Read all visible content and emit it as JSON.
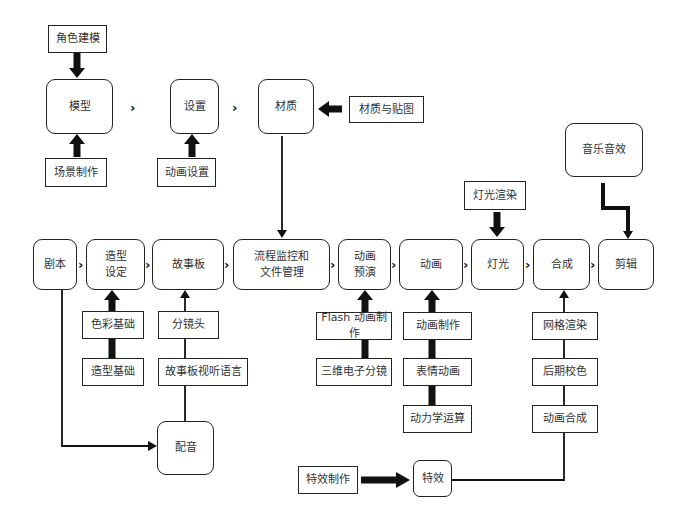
{
  "diagram": {
    "top_row": {
      "model": "模型",
      "settings": "设置",
      "material": "材质"
    },
    "top_inputs": {
      "character_modeling": "角色建模",
      "scene_making": "场景制作",
      "anim_settings": "动画设置",
      "material_mapping": "材质与贴图",
      "music_sfx": "音乐音效",
      "light_render": "灯光渲染"
    },
    "main_row": {
      "script": "剧本",
      "character_design": "造型\n设定",
      "storyboard": "故事板",
      "process_mgmt": "流程监控和\n文件管理",
      "anim_preview": "动画\n预演",
      "animation": "动画",
      "lighting": "灯光",
      "compositing": "合成",
      "editing": "剪辑"
    },
    "bottom_inputs": {
      "color_basics": "色彩基础",
      "form_basics": "造型基础",
      "shot_split": "分镜头",
      "storyboard_av_lang": "故事板视听语言",
      "dubbing": "配音",
      "flash_anim": "Flash 动画制作",
      "3d_storyboard": "三维电子分镜",
      "anim_making": "动画制作",
      "facial_anim": "表情动画",
      "dynamics": "动力学运算",
      "mesh_render": "网格渲染",
      "color_grading": "后期校色",
      "anim_composite": "动画合成",
      "vfx_making": "特效制作",
      "vfx": "特效"
    },
    "connector_glyph": "›"
  }
}
